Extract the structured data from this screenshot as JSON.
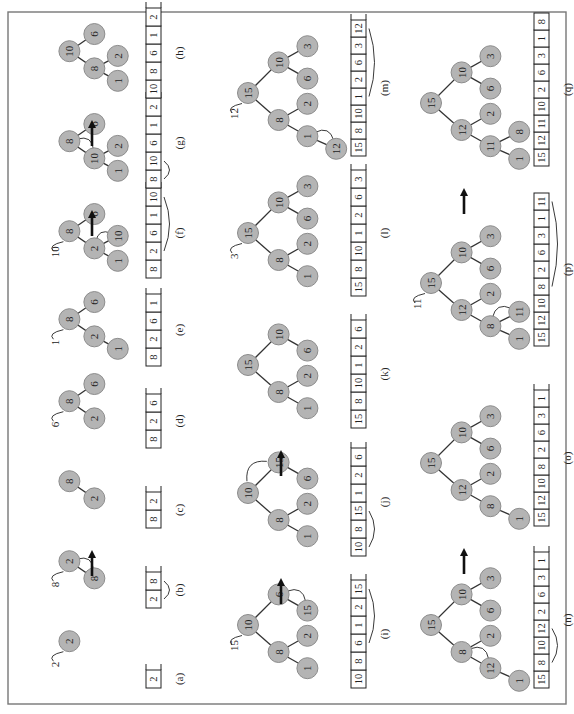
{
  "figure": {
    "orientation": "rotated-90-ccw",
    "arrow_color": "#111111",
    "node_fill": "#b4b4b4",
    "frame_color": "#777777"
  },
  "panels": [
    {
      "id": "a",
      "label": "(a)",
      "row": 0,
      "col": 0,
      "insert": "2",
      "tree": [
        {
          "v": "2",
          "x": 60,
          "y": 30
        }
      ],
      "edges": [],
      "array": [
        "2"
      ],
      "array_open": true
    },
    {
      "id": "b",
      "label": "(b)",
      "row": 0,
      "col": 1,
      "insert": "8",
      "tree": [
        {
          "v": "2",
          "x": 60,
          "y": 30
        },
        {
          "v": "8",
          "x": 38,
          "y": 62
        }
      ],
      "edges": [
        [
          0,
          1
        ]
      ],
      "array": [
        "2",
        "8"
      ],
      "array_open": true,
      "swap_tree": [
        0,
        1
      ],
      "swap_array": [
        0,
        1
      ]
    },
    {
      "id": "c",
      "label": "(c)",
      "row": 0,
      "col": 2,
      "tree": [
        {
          "v": "8",
          "x": 60,
          "y": 30
        },
        {
          "v": "2",
          "x": 38,
          "y": 62
        }
      ],
      "edges": [
        [
          0,
          1
        ]
      ],
      "array": [
        "8",
        "2"
      ],
      "array_open": true
    },
    {
      "id": "d",
      "label": "(d)",
      "row": 0,
      "col": 3,
      "insert": "6",
      "tree": [
        {
          "v": "8",
          "x": 60,
          "y": 30
        },
        {
          "v": "2",
          "x": 38,
          "y": 62
        },
        {
          "v": "6",
          "x": 82,
          "y": 62
        }
      ],
      "edges": [
        [
          0,
          1
        ],
        [
          0,
          2
        ]
      ],
      "array": [
        "8",
        "2",
        "6"
      ],
      "array_open": true
    },
    {
      "id": "e",
      "label": "(e)",
      "row": 0,
      "col": 4,
      "insert": "1",
      "tree": [
        {
          "v": "8",
          "x": 60,
          "y": 30
        },
        {
          "v": "2",
          "x": 38,
          "y": 62
        },
        {
          "v": "6",
          "x": 82,
          "y": 62
        },
        {
          "v": "1",
          "x": 22,
          "y": 92
        }
      ],
      "edges": [
        [
          0,
          1
        ],
        [
          0,
          2
        ],
        [
          1,
          3
        ]
      ],
      "array": [
        "8",
        "2",
        "6",
        "1"
      ],
      "array_open": true
    },
    {
      "id": "f",
      "label": "(f)",
      "row": 0,
      "col": 5,
      "insert": "10",
      "tree": [
        {
          "v": "8",
          "x": 60,
          "y": 30
        },
        {
          "v": "2",
          "x": 38,
          "y": 62
        },
        {
          "v": "6",
          "x": 82,
          "y": 62
        },
        {
          "v": "1",
          "x": 22,
          "y": 92
        },
        {
          "v": "10",
          "x": 54,
          "y": 92
        }
      ],
      "edges": [
        [
          0,
          1
        ],
        [
          0,
          2
        ],
        [
          1,
          3
        ],
        [
          1,
          4
        ]
      ],
      "array": [
        "8",
        "2",
        "6",
        "1",
        "10"
      ],
      "array_open": true,
      "swap_tree": [
        1,
        4
      ],
      "swap_array": [
        1,
        4
      ]
    },
    {
      "id": "g",
      "label": "(g)",
      "row": 0,
      "col": 6,
      "tree": [
        {
          "v": "8",
          "x": 60,
          "y": 30
        },
        {
          "v": "10",
          "x": 38,
          "y": 62
        },
        {
          "v": "6",
          "x": 82,
          "y": 62
        },
        {
          "v": "1",
          "x": 22,
          "y": 92
        },
        {
          "v": "2",
          "x": 54,
          "y": 92
        }
      ],
      "edges": [
        [
          0,
          1
        ],
        [
          0,
          2
        ],
        [
          1,
          3
        ],
        [
          1,
          4
        ]
      ],
      "array": [
        "8",
        "10",
        "6",
        "1",
        "2"
      ],
      "array_open": true,
      "swap_tree": [
        0,
        1
      ],
      "swap_array": [
        0,
        1
      ]
    },
    {
      "id": "h",
      "label": "(h)",
      "row": 0,
      "col": 7,
      "tree": [
        {
          "v": "10",
          "x": 60,
          "y": 30
        },
        {
          "v": "8",
          "x": 38,
          "y": 62
        },
        {
          "v": "6",
          "x": 82,
          "y": 62
        },
        {
          "v": "1",
          "x": 22,
          "y": 92
        },
        {
          "v": "2",
          "x": 54,
          "y": 92
        }
      ],
      "edges": [
        [
          0,
          1
        ],
        [
          0,
          2
        ],
        [
          1,
          3
        ],
        [
          1,
          4
        ]
      ],
      "array": [
        "10",
        "8",
        "6",
        "1",
        "2"
      ],
      "array_open": true
    },
    {
      "id": "i",
      "label": "(i)",
      "row": 1,
      "col": 0,
      "insert": "15",
      "tree": [
        {
          "v": "10",
          "x": 70,
          "y": 30
        },
        {
          "v": "8",
          "x": 40,
          "y": 64
        },
        {
          "v": "6",
          "x": 104,
          "y": 64
        },
        {
          "v": "1",
          "x": 22,
          "y": 96
        },
        {
          "v": "2",
          "x": 58,
          "y": 96
        },
        {
          "v": "15",
          "x": 86,
          "y": 96
        }
      ],
      "edges": [
        [
          0,
          1
        ],
        [
          0,
          2
        ],
        [
          1,
          3
        ],
        [
          1,
          4
        ],
        [
          2,
          5
        ]
      ],
      "array": [
        "10",
        "8",
        "6",
        "1",
        "2",
        "15"
      ],
      "array_open": true,
      "swap_tree": [
        2,
        5
      ],
      "swap_array": [
        2,
        5
      ]
    },
    {
      "id": "j",
      "label": "(j)",
      "row": 1,
      "col": 1,
      "tree": [
        {
          "v": "10",
          "x": 70,
          "y": 30
        },
        {
          "v": "8",
          "x": 40,
          "y": 64
        },
        {
          "v": "15",
          "x": 104,
          "y": 64
        },
        {
          "v": "1",
          "x": 22,
          "y": 96
        },
        {
          "v": "2",
          "x": 58,
          "y": 96
        },
        {
          "v": "6",
          "x": 86,
          "y": 96
        }
      ],
      "edges": [
        [
          0,
          1
        ],
        [
          0,
          2
        ],
        [
          1,
          3
        ],
        [
          1,
          4
        ],
        [
          2,
          5
        ]
      ],
      "array": [
        "10",
        "8",
        "15",
        "1",
        "2",
        "6"
      ],
      "array_open": true,
      "swap_tree": [
        0,
        2
      ],
      "swap_array": [
        0,
        2
      ]
    },
    {
      "id": "k",
      "label": "(k)",
      "row": 1,
      "col": 2,
      "tree": [
        {
          "v": "15",
          "x": 70,
          "y": 30
        },
        {
          "v": "8",
          "x": 40,
          "y": 64
        },
        {
          "v": "10",
          "x": 104,
          "y": 64
        },
        {
          "v": "1",
          "x": 22,
          "y": 96
        },
        {
          "v": "2",
          "x": 58,
          "y": 96
        },
        {
          "v": "6",
          "x": 86,
          "y": 96
        }
      ],
      "edges": [
        [
          0,
          1
        ],
        [
          0,
          2
        ],
        [
          1,
          3
        ],
        [
          1,
          4
        ],
        [
          2,
          5
        ]
      ],
      "array": [
        "15",
        "8",
        "10",
        "1",
        "2",
        "6"
      ],
      "array_open": true
    },
    {
      "id": "l",
      "label": "(l)",
      "row": 1,
      "col": 3,
      "insert": "3",
      "tree": [
        {
          "v": "15",
          "x": 70,
          "y": 30
        },
        {
          "v": "8",
          "x": 40,
          "y": 64
        },
        {
          "v": "10",
          "x": 104,
          "y": 64
        },
        {
          "v": "1",
          "x": 22,
          "y": 96
        },
        {
          "v": "2",
          "x": 58,
          "y": 96
        },
        {
          "v": "6",
          "x": 86,
          "y": 96
        },
        {
          "v": "3",
          "x": 122,
          "y": 96
        }
      ],
      "edges": [
        [
          0,
          1
        ],
        [
          0,
          2
        ],
        [
          1,
          3
        ],
        [
          1,
          4
        ],
        [
          2,
          5
        ],
        [
          2,
          6
        ]
      ],
      "array": [
        "15",
        "8",
        "10",
        "1",
        "2",
        "6",
        "3"
      ],
      "array_open": true
    },
    {
      "id": "m",
      "label": "(m)",
      "row": 1,
      "col": 4,
      "insert": "12",
      "tree": [
        {
          "v": "15",
          "x": 70,
          "y": 30
        },
        {
          "v": "8",
          "x": 40,
          "y": 64
        },
        {
          "v": "10",
          "x": 104,
          "y": 64
        },
        {
          "v": "1",
          "x": 22,
          "y": 96
        },
        {
          "v": "2",
          "x": 58,
          "y": 96
        },
        {
          "v": "6",
          "x": 86,
          "y": 96
        },
        {
          "v": "3",
          "x": 122,
          "y": 96
        },
        {
          "v": "12",
          "x": 8,
          "y": 128
        }
      ],
      "edges": [
        [
          0,
          1
        ],
        [
          0,
          2
        ],
        [
          1,
          3
        ],
        [
          1,
          4
        ],
        [
          2,
          5
        ],
        [
          2,
          6
        ],
        [
          3,
          7
        ]
      ],
      "array": [
        "15",
        "8",
        "10",
        "1",
        "2",
        "6",
        "3",
        "12"
      ],
      "array_open": true,
      "swap_tree": [
        3,
        7
      ],
      "swap_array": [
        3,
        7
      ]
    },
    {
      "id": "n",
      "label": "(n)",
      "row": 2,
      "col": 0,
      "tree": [
        {
          "v": "15",
          "x": 70,
          "y": 30
        },
        {
          "v": "8",
          "x": 40,
          "y": 64
        },
        {
          "v": "10",
          "x": 104,
          "y": 64
        },
        {
          "v": "12",
          "x": 22,
          "y": 96
        },
        {
          "v": "2",
          "x": 58,
          "y": 96
        },
        {
          "v": "6",
          "x": 86,
          "y": 96
        },
        {
          "v": "3",
          "x": 122,
          "y": 96
        },
        {
          "v": "1",
          "x": 8,
          "y": 128
        }
      ],
      "edges": [
        [
          0,
          1
        ],
        [
          0,
          2
        ],
        [
          1,
          3
        ],
        [
          1,
          4
        ],
        [
          2,
          5
        ],
        [
          2,
          6
        ],
        [
          3,
          7
        ]
      ],
      "array": [
        "15",
        "8",
        "10",
        "12",
        "2",
        "6",
        "3",
        "1"
      ],
      "array_open": true,
      "swap_tree": [
        1,
        3
      ],
      "swap_array": [
        1,
        3
      ]
    },
    {
      "id": "o",
      "label": "(o)",
      "row": 2,
      "col": 1,
      "tree": [
        {
          "v": "15",
          "x": 70,
          "y": 30
        },
        {
          "v": "12",
          "x": 40,
          "y": 64
        },
        {
          "v": "10",
          "x": 104,
          "y": 64
        },
        {
          "v": "8",
          "x": 22,
          "y": 96
        },
        {
          "v": "2",
          "x": 58,
          "y": 96
        },
        {
          "v": "6",
          "x": 86,
          "y": 96
        },
        {
          "v": "3",
          "x": 122,
          "y": 96
        },
        {
          "v": "1",
          "x": 8,
          "y": 128
        }
      ],
      "edges": [
        [
          0,
          1
        ],
        [
          0,
          2
        ],
        [
          1,
          3
        ],
        [
          1,
          4
        ],
        [
          2,
          5
        ],
        [
          2,
          6
        ],
        [
          3,
          7
        ]
      ],
      "array": [
        "15",
        "12",
        "10",
        "8",
        "2",
        "6",
        "3",
        "1"
      ],
      "array_open": true
    },
    {
      "id": "p",
      "label": "(p)",
      "row": 2,
      "col": 2,
      "insert": "11",
      "tree": [
        {
          "v": "15",
          "x": 70,
          "y": 30
        },
        {
          "v": "12",
          "x": 40,
          "y": 64
        },
        {
          "v": "10",
          "x": 104,
          "y": 64
        },
        {
          "v": "8",
          "x": 22,
          "y": 96
        },
        {
          "v": "2",
          "x": 58,
          "y": 96
        },
        {
          "v": "6",
          "x": 86,
          "y": 96
        },
        {
          "v": "3",
          "x": 122,
          "y": 96
        },
        {
          "v": "1",
          "x": 8,
          "y": 128
        },
        {
          "v": "11",
          "x": 38,
          "y": 128
        }
      ],
      "edges": [
        [
          0,
          1
        ],
        [
          0,
          2
        ],
        [
          1,
          3
        ],
        [
          1,
          4
        ],
        [
          2,
          5
        ],
        [
          2,
          6
        ],
        [
          3,
          7
        ],
        [
          3,
          8
        ]
      ],
      "array": [
        "15",
        "12",
        "10",
        "8",
        "2",
        "6",
        "3",
        "1",
        "11"
      ],
      "array_open": false,
      "swap_tree": [
        3,
        8
      ],
      "swap_array": [
        3,
        8
      ]
    },
    {
      "id": "q",
      "label": "(q)",
      "row": 2,
      "col": 3,
      "tree": [
        {
          "v": "15",
          "x": 70,
          "y": 30
        },
        {
          "v": "12",
          "x": 40,
          "y": 64
        },
        {
          "v": "10",
          "x": 104,
          "y": 64
        },
        {
          "v": "11",
          "x": 22,
          "y": 96
        },
        {
          "v": "2",
          "x": 58,
          "y": 96
        },
        {
          "v": "6",
          "x": 86,
          "y": 96
        },
        {
          "v": "3",
          "x": 122,
          "y": 96
        },
        {
          "v": "1",
          "x": 8,
          "y": 128
        },
        {
          "v": "8",
          "x": 38,
          "y": 128
        }
      ],
      "edges": [
        [
          0,
          1
        ],
        [
          0,
          2
        ],
        [
          1,
          3
        ],
        [
          1,
          4
        ],
        [
          2,
          5
        ],
        [
          2,
          6
        ],
        [
          3,
          7
        ],
        [
          3,
          8
        ]
      ],
      "array": [
        "15",
        "12",
        "11",
        "10",
        "2",
        "6",
        "3",
        "1",
        "8"
      ],
      "array_open": false
    }
  ],
  "transition_arrows": [
    {
      "row": 0,
      "after_col": 1
    },
    {
      "row": 0,
      "after_col": 5
    },
    {
      "row": 0,
      "after_col": 6
    },
    {
      "row": 1,
      "after_col": 0
    },
    {
      "row": 1,
      "after_col": 1
    },
    {
      "row": 1,
      "after_col": 4
    },
    {
      "row": 2,
      "after_col": 0
    },
    {
      "row": 2,
      "after_col": 2
    }
  ]
}
